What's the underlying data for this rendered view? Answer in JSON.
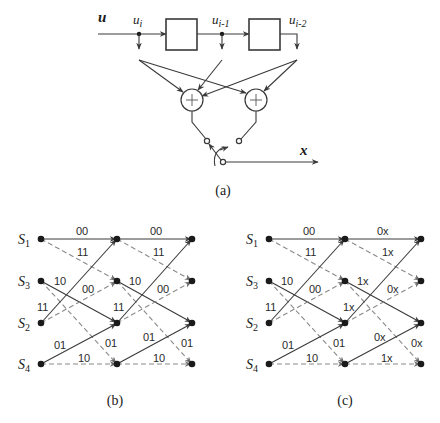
{
  "panel_a": {
    "caption": "(a)",
    "input_label": "u",
    "output_label": "x",
    "taps": [
      {
        "base": "u",
        "sub": "i"
      },
      {
        "base": "u",
        "sub": "i-1"
      },
      {
        "base": "u",
        "sub": "i-2"
      }
    ],
    "adder_symbol": "+",
    "delay_elements": 2,
    "adders": 2
  },
  "panel_b": {
    "caption": "(b)",
    "states": [
      {
        "base": "S",
        "sub": "1"
      },
      {
        "base": "S",
        "sub": "3"
      },
      {
        "base": "S",
        "sub": "2"
      },
      {
        "base": "S",
        "sub": "4"
      }
    ],
    "stage1_labels": {
      "s1_s1": "00",
      "s1_s3": "11",
      "s3_s2": "10",
      "s2_s3": "00",
      "s2_s1": "11",
      "s3_s4": "01",
      "s4_s2": "01",
      "s4_s4": "10"
    },
    "stage2_labels": {
      "s1_s1": "00",
      "s1_s3": "11",
      "s3_s2": "10",
      "s2_s3": "00",
      "s2_s1": "11",
      "s3_s4": "01",
      "s4_s2": "01",
      "s4_s4": "10"
    }
  },
  "panel_c": {
    "caption": "(c)",
    "states": [
      {
        "base": "S",
        "sub": "1"
      },
      {
        "base": "S",
        "sub": "3"
      },
      {
        "base": "S",
        "sub": "2"
      },
      {
        "base": "S",
        "sub": "4"
      }
    ],
    "stage1_labels": {
      "s1_s1": "00",
      "s1_s3": "11",
      "s3_s2": "10",
      "s2_s3": "00",
      "s2_s1": "11",
      "s3_s4": "01",
      "s4_s2": "01",
      "s4_s4": "10"
    },
    "stage2_labels": {
      "s1_s1": "0x",
      "s1_s3": "1x",
      "s3_s2": "1x",
      "s2_s3": "0x",
      "s2_s1": "1x",
      "s3_s4": "0x",
      "s4_s2": "0x",
      "s4_s4": "1x"
    }
  },
  "legend": {
    "solid_edge": "input bit 0",
    "dashed_edge": "input bit 1"
  }
}
